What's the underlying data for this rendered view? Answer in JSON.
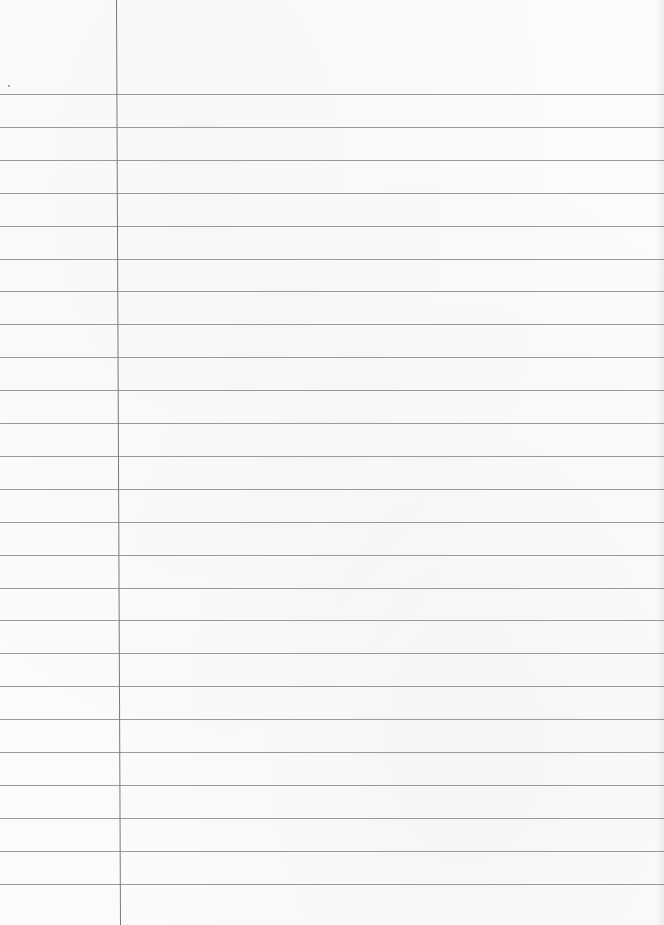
{
  "sheet": {
    "type": "lined-paper",
    "background_color": "#fbfbfb",
    "rule_color": "#9a9a9a",
    "margin_color": "#7a7a7a",
    "first_rule_y": 94,
    "rule_spacing": 32.9,
    "rule_count": 25,
    "margin_x_top": 116,
    "margin_x_bottom": 120,
    "content": ""
  }
}
